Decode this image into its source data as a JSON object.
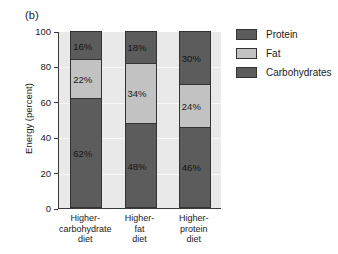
{
  "figure": {
    "panel_label": "(b)"
  },
  "chart_data": {
    "type": "bar",
    "stacked": true,
    "title": "",
    "xlabel": "",
    "ylabel": "Energy (percent)",
    "ylim": [
      0,
      100
    ],
    "yticks": [
      0,
      20,
      40,
      60,
      80,
      100
    ],
    "ytick_labels": [
      "0",
      "20",
      "40",
      "60",
      "80",
      "100"
    ],
    "grid": true,
    "legend_position": "right",
    "categories": [
      "Higher-carbohydrate diet",
      "Higher-fat diet",
      "Higher-protein diet"
    ],
    "category_label_lines": [
      [
        "Higher-",
        "carbohydrate",
        "diet"
      ],
      [
        "Higher-",
        "fat",
        "diet"
      ],
      [
        "Higher-",
        "protein",
        "diet"
      ]
    ],
    "series": [
      {
        "name": "Carbohydrates",
        "color": "#5c5c5c",
        "values": [
          62,
          48,
          46
        ],
        "labels": [
          "62%",
          "48%",
          "46%"
        ]
      },
      {
        "name": "Fat",
        "color": "#c2c2c2",
        "values": [
          22,
          34,
          24
        ],
        "labels": [
          "22%",
          "34%",
          "24%"
        ]
      },
      {
        "name": "Protein",
        "color": "#5c5c5c",
        "values": [
          16,
          18,
          30
        ],
        "labels": [
          "16%",
          "18%",
          "30%"
        ]
      }
    ],
    "legend_entries": [
      {
        "label": "Protein",
        "color": "#5c5c5c"
      },
      {
        "label": "Fat",
        "color": "#c2c2c2"
      },
      {
        "label": "Carbohydrates",
        "color": "#5c5c5c"
      }
    ],
    "colors": {
      "protein": "#5c5c5c",
      "fat": "#c2c2c2",
      "carbohydrates": "#5c5c5c",
      "plot_background": "#e9e9e9",
      "gridline": "#f7f7f7",
      "axis": "#3b3b3b",
      "text": "#1a1a1a"
    }
  }
}
